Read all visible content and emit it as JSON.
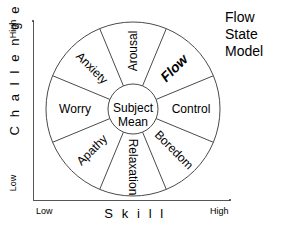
{
  "title": {
    "lines": [
      "Flow",
      "State",
      "Model"
    ]
  },
  "axes": {
    "y": {
      "name": "C h a l l e n g e",
      "high": "High",
      "low": "Low"
    },
    "x": {
      "name": "S k i l l",
      "low": "Low",
      "high": "High"
    }
  },
  "center": {
    "line1": "Subject",
    "line2": "Mean"
  },
  "colors": {
    "stroke": "#4a4a4a",
    "axis": "#555555",
    "text": "#000000",
    "background": "#ffffff"
  },
  "chart_data": {
    "type": "pie",
    "title": "Flow State Model",
    "xlabel": "S k i l l",
    "ylabel": "C h a l l e n g e",
    "grid": false,
    "legend": "none",
    "center_label": "Subject Mean",
    "segment_count": 8,
    "segment_degrees": 45,
    "center": {
      "x": 133,
      "y": 109
    },
    "outer_radius": 87,
    "inner_radius": 25,
    "categories": [
      "Arousal",
      "Flow",
      "Control",
      "Boredom",
      "Relaxation",
      "Apathy",
      "Worry",
      "Anxiety"
    ],
    "values": [
      45,
      45,
      45,
      45,
      45,
      45,
      45,
      45
    ],
    "segments": [
      {
        "label": "Arousal",
        "angle_center_deg": 90,
        "emphasis": "normal",
        "position": "top"
      },
      {
        "label": "Flow",
        "angle_center_deg": 45,
        "emphasis": "bold-italic",
        "position": "upper-right"
      },
      {
        "label": "Control",
        "angle_center_deg": 0,
        "emphasis": "normal",
        "position": "right"
      },
      {
        "label": "Boredom",
        "angle_center_deg": -45,
        "emphasis": "normal",
        "position": "lower-right"
      },
      {
        "label": "Relaxation",
        "angle_center_deg": -90,
        "emphasis": "normal",
        "position": "bottom"
      },
      {
        "label": "Apathy",
        "angle_center_deg": -135,
        "emphasis": "normal",
        "position": "lower-left"
      },
      {
        "label": "Worry",
        "angle_center_deg": 180,
        "emphasis": "normal",
        "position": "left"
      },
      {
        "label": "Anxiety",
        "angle_center_deg": 135,
        "emphasis": "normal",
        "position": "upper-left"
      }
    ]
  }
}
